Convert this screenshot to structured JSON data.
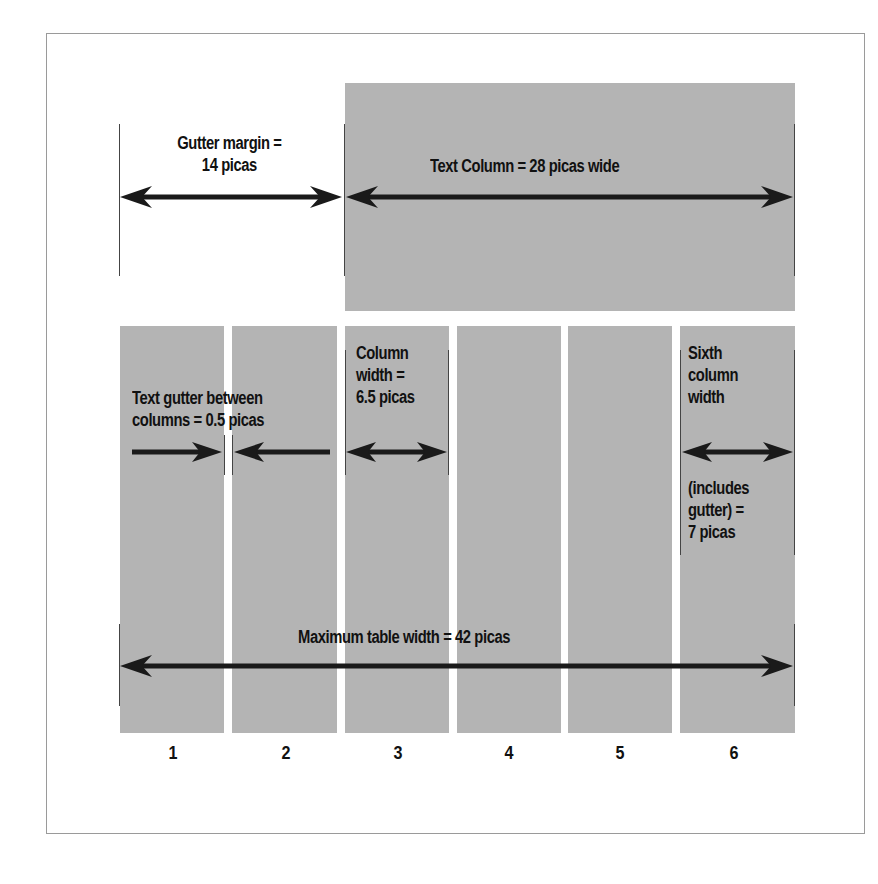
{
  "diagram": {
    "top_section": {
      "gutter_margin_label": "Gutter margin =",
      "gutter_margin_value": "14 picas",
      "text_column_label": "Text Column = 28 picas wide"
    },
    "columns_section": {
      "text_gutter_line1": "Text gutter between",
      "text_gutter_line2": "columns = 0.5 picas",
      "column_width_line1": "Column",
      "column_width_line2": "width =",
      "column_width_line3": "6.5 picas",
      "sixth_line1": "Sixth",
      "sixth_line2": "column",
      "sixth_line3": "width",
      "sixth_line4": "(includes",
      "sixth_line5": "gutter) =",
      "sixth_line6": "7 picas",
      "max_table_label": "Maximum table width = 42 picas"
    },
    "column_numbers": [
      "1",
      "2",
      "3",
      "4",
      "5",
      "6"
    ],
    "colors": {
      "gray_fill": "#b4b4b4",
      "arrow": "#1a1a1a",
      "border": "#9a9a9a"
    }
  }
}
